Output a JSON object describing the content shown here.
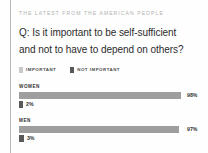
{
  "kicker": "THE LATEST FROM THE AMERICAN PEOPLE",
  "question": {
    "line1": "Q: Is it important to be self-sufficient",
    "line2": "and not to have to depend on others?"
  },
  "legend": [
    {
      "label": "IMPORTANT",
      "color": "#c9c9c9"
    },
    {
      "label": "NOT IMPORTANT",
      "color": "#595959"
    }
  ],
  "colors": {
    "important": "#9e9e9e",
    "not_important": "#595959",
    "rule": "#b9b9b9",
    "kicker_text": "#b0b0ae",
    "question_text": "#2b2b2b"
  },
  "chart_data": {
    "type": "bar",
    "title": "Q: Is it important to be self-sufficient and not to have to depend on others?",
    "xlabel": "",
    "ylabel": "",
    "xlim": [
      0,
      100
    ],
    "grid": false,
    "legend_position": "top",
    "categories": [
      "WOMEN",
      "MEN"
    ],
    "series": [
      {
        "name": "IMPORTANT",
        "color": "#9e9e9e",
        "values": [
          98,
          97
        ],
        "labels": [
          "98%",
          "97%"
        ]
      },
      {
        "name": "NOT IMPORTANT",
        "color": "#595959",
        "values": [
          2,
          3
        ],
        "labels": [
          "2%",
          "3%"
        ]
      }
    ]
  },
  "groups": [
    {
      "title": "WOMEN",
      "bars": [
        {
          "series": "IMPORTANT",
          "value": 98,
          "label": "98%",
          "color": "#9e9e9e"
        },
        {
          "series": "NOT IMPORTANT",
          "value": 2,
          "label": "2%",
          "color": "#595959"
        }
      ]
    },
    {
      "title": "MEN",
      "bars": [
        {
          "series": "IMPORTANT",
          "value": 97,
          "label": "97%",
          "color": "#9e9e9e"
        },
        {
          "series": "NOT IMPORTANT",
          "value": 3,
          "label": "3%",
          "color": "#595959"
        }
      ]
    }
  ]
}
